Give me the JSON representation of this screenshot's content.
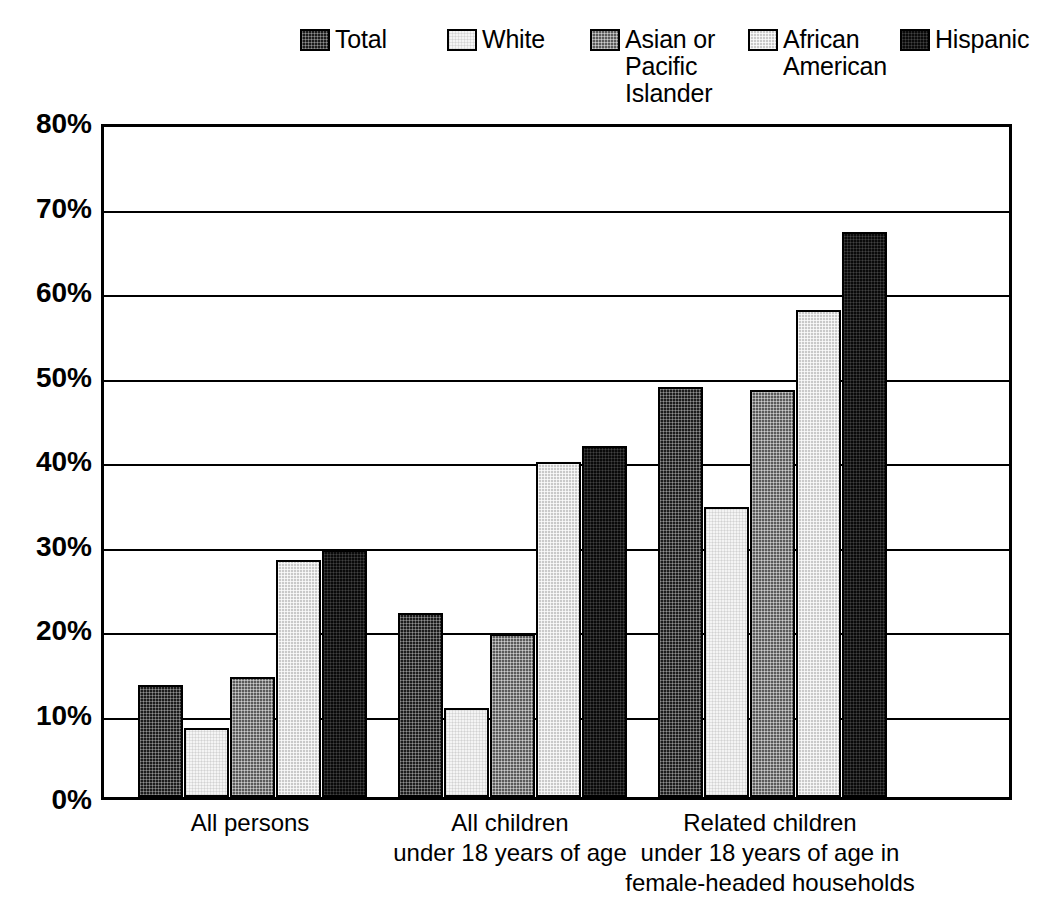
{
  "legend": {
    "items": [
      {
        "label": "Total",
        "pattern": "pat-total",
        "left": 0,
        "swatch": "legend-swatch-total"
      },
      {
        "label": "White",
        "pattern": "pat-white",
        "left": 147,
        "swatch": "legend-swatch-white"
      },
      {
        "label": "Asian or\nPacific\nIslander",
        "pattern": "pat-asian",
        "left": 290,
        "swatch": "legend-swatch-asian"
      },
      {
        "label": "African\nAmerican",
        "pattern": "pat-african",
        "left": 448,
        "swatch": "legend-swatch-african-american"
      },
      {
        "label": "Hispanic",
        "pattern": "pat-hispanic",
        "left": 600,
        "swatch": "legend-swatch-hispanic"
      }
    ]
  },
  "axis": {
    "y_ticks": [
      "80%",
      "70%",
      "60%",
      "50%",
      "40%",
      "30%",
      "20%",
      "10%",
      "0%"
    ],
    "y_min": 0,
    "y_max": 80
  },
  "chart_data": {
    "type": "bar",
    "title": "",
    "subtitle": "",
    "xlabel": "",
    "ylabel": "",
    "ylim": [
      0,
      80
    ],
    "y_tick_step": 10,
    "grid": true,
    "legend_position": "top",
    "value_unit": "percent",
    "categories": [
      "All persons",
      "All children\nunder 18 years of age",
      "Related children\nunder 18 years of age in\nfemale-headed households"
    ],
    "series": [
      {
        "name": "Total",
        "values": [
          13.3,
          21.8,
          48.5
        ]
      },
      {
        "name": "White",
        "values": [
          8.2,
          10.5,
          34.3
        ]
      },
      {
        "name": "Asian or Pacific Islander",
        "values": [
          14.2,
          19.3,
          48.2
        ]
      },
      {
        "name": "African American",
        "values": [
          28.1,
          39.7,
          57.6
        ]
      },
      {
        "name": "Hispanic",
        "values": [
          29.2,
          41.5,
          66.9
        ]
      }
    ]
  },
  "colors": {
    "axis": "#000000",
    "background": "#ffffff",
    "total": "#1c1c1c",
    "white": "#f4f4f4",
    "asian": "#5a5a5a",
    "african_american": "#c9c9c9",
    "hispanic": "#0a0a0a"
  }
}
